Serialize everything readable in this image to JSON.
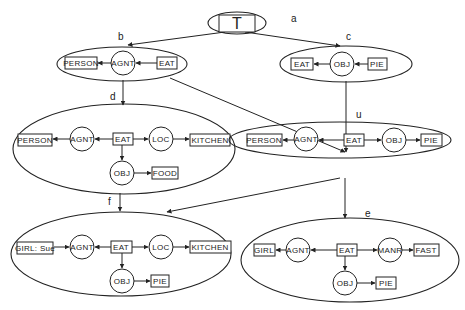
{
  "diagram": {
    "root": {
      "id": "a",
      "label": "T"
    },
    "graphs": [
      {
        "id": "b",
        "concepts": [
          "PERSON",
          "EAT"
        ],
        "relations": [
          "AGNT"
        ],
        "edges": [
          [
            "EAT",
            "AGNT"
          ],
          [
            "AGNT",
            "PERSON"
          ]
        ]
      },
      {
        "id": "c",
        "concepts": [
          "EAT",
          "PIE"
        ],
        "relations": [
          "OBJ"
        ],
        "edges": [
          [
            "PIE",
            "OBJ"
          ],
          [
            "OBJ",
            "EAT"
          ]
        ]
      },
      {
        "id": "d",
        "concepts": [
          "PERSON",
          "EAT",
          "KITCHEN",
          "FOOD"
        ],
        "relations": [
          "AGNT",
          "LOC",
          "OBJ"
        ],
        "edges": [
          [
            "EAT",
            "AGNT"
          ],
          [
            "AGNT",
            "PERSON"
          ],
          [
            "EAT",
            "LOC"
          ],
          [
            "LOC",
            "KITCHEN"
          ],
          [
            "EAT",
            "OBJ"
          ],
          [
            "OBJ",
            "FOOD"
          ]
        ]
      },
      {
        "id": "u",
        "concepts": [
          "PERSON",
          "EAT",
          "PIE"
        ],
        "relations": [
          "AGNT",
          "OBJ"
        ],
        "edges": [
          [
            "EAT",
            "AGNT"
          ],
          [
            "AGNT",
            "PERSON"
          ],
          [
            "EAT",
            "OBJ"
          ],
          [
            "OBJ",
            "PIE"
          ]
        ]
      },
      {
        "id": "f",
        "concepts": [
          "GIRL: Sue",
          "EAT",
          "KITCHEN",
          "PIE"
        ],
        "relations": [
          "AGNT",
          "LOC",
          "OBJ"
        ],
        "edges": [
          [
            "GIRL: Sue",
            "AGNT"
          ],
          [
            "EAT",
            "AGNT"
          ],
          [
            "EAT",
            "LOC"
          ],
          [
            "LOC",
            "KITCHEN"
          ],
          [
            "EAT",
            "OBJ"
          ],
          [
            "OBJ",
            "PIE"
          ]
        ]
      },
      {
        "id": "e",
        "concepts": [
          "GIRL",
          "EAT",
          "FAST",
          "PIE"
        ],
        "relations": [
          "AGNT",
          "MANR",
          "OBJ"
        ],
        "edges": [
          [
            "EAT",
            "AGNT"
          ],
          [
            "AGNT",
            "GIRL"
          ],
          [
            "EAT",
            "MANR"
          ],
          [
            "MANR",
            "FAST"
          ],
          [
            "EAT",
            "OBJ"
          ],
          [
            "OBJ",
            "PIE"
          ]
        ]
      }
    ],
    "hierarchy_edges": [
      [
        "a",
        "b"
      ],
      [
        "a",
        "c"
      ],
      [
        "b",
        "d"
      ],
      [
        "b",
        "u"
      ],
      [
        "c",
        "u"
      ],
      [
        "d",
        "f"
      ],
      [
        "u",
        "f"
      ],
      [
        "u",
        "e"
      ]
    ]
  },
  "labels": {
    "a": "a",
    "b": "b",
    "c": "c",
    "d": "d",
    "u": "u",
    "e": "e",
    "f": "f",
    "T": "T",
    "b_person": "PERSON",
    "b_agnt": "AGNT",
    "b_eat": "EAT",
    "c_eat": "EAT",
    "c_obj": "OBJ",
    "c_pie": "PIE",
    "d_person": "PERSON",
    "d_agnt": "AGNT",
    "d_eat": "EAT",
    "d_loc": "LOC",
    "d_kitchen": "KITCHEN",
    "d_obj": "OBJ",
    "d_food": "FOOD",
    "u_person": "PERSON",
    "u_agnt": "AGNT",
    "u_eat": "EAT",
    "u_obj": "OBJ",
    "u_pie": "PIE",
    "f_girl": "GIRL: Sue",
    "f_agnt": "AGNT",
    "f_eat": "EAT",
    "f_loc": "LOC",
    "f_kitchen": "KITCHEN",
    "f_obj": "OBJ",
    "f_pie": "PIE",
    "e_girl": "GIRL",
    "e_agnt": "AGNT",
    "e_eat": "EAT",
    "e_manr": "MANR",
    "e_fast": "FAST",
    "e_obj": "OBJ",
    "e_pie": "PIE"
  }
}
